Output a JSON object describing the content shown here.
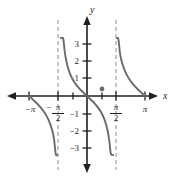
{
  "figure": {
    "width": 173,
    "height": 177,
    "background": "#ffffff",
    "curve_color": "#6b6b6b",
    "axis_color": "#231f20",
    "asymptote_color": "#8c8c8c"
  },
  "axes": {
    "x_label": "x",
    "y_label": "y",
    "x_axis_y_px": 96,
    "y_axis_x_px": 87,
    "x_left_px": 8,
    "x_right_px": 157,
    "y_top_px": 16,
    "y_bottom_px": 172,
    "px_per_half_pi": 29,
    "px_per_unit": 17
  },
  "x_ticks": [
    {
      "label": "−π",
      "value": -3.14159,
      "x_px": 29,
      "show_label": true
    },
    {
      "label": "",
      "value": -1.5708,
      "x_px": 58,
      "show_label": false
    },
    {
      "label": "",
      "value": -0.7854,
      "x_px": 73,
      "show_label": false
    },
    {
      "label": "",
      "value": 0.7854,
      "x_px": 102,
      "show_label": false
    },
    {
      "label": "",
      "value": 1.5708,
      "x_px": 116,
      "show_label": false
    },
    {
      "label": "π",
      "value": 3.14159,
      "x_px": 145,
      "show_label": true
    }
  ],
  "x_fraction_ticks": [
    {
      "lead": "−",
      "numerator": "π",
      "denominator": "2",
      "value": -1.5708,
      "x_px": 58
    },
    {
      "lead": "",
      "numerator": "π",
      "denominator": "2",
      "value": 1.5708,
      "x_px": 116
    }
  ],
  "y_ticks": [
    {
      "label": "3",
      "value": 3,
      "y_px": 44
    },
    {
      "label": "2",
      "value": 2,
      "y_px": 61
    },
    {
      "label": "1",
      "value": 1,
      "y_px": 78
    },
    {
      "label": "−1",
      "value": -1,
      "y_px": 114
    },
    {
      "label": "−2",
      "value": -2,
      "y_px": 131
    },
    {
      "label": "−3",
      "value": -3,
      "y_px": 148
    }
  ],
  "asymptotes": [
    {
      "name": "asymptote-neg-half-pi",
      "value": -1.5708,
      "x_px": 58,
      "y_top_px": 20,
      "y_bottom_px": 170
    },
    {
      "name": "asymptote-pos-half-pi",
      "value": 1.5708,
      "x_px": 116,
      "y_top_px": 20,
      "y_bottom_px": 170
    }
  ],
  "markers": [
    {
      "name": "point-on-curve",
      "x_value": 0.7854,
      "y_value": 1,
      "x_px": 102,
      "y_px": 89,
      "radius_px": 2.4
    }
  ],
  "chart_data": {
    "type": "line",
    "title": "",
    "subtitle": "",
    "xlabel": "x",
    "ylabel": "y",
    "function": "y = tan(x)",
    "xlim": [
      -3.6,
      3.6
    ],
    "ylim": [
      -3.6,
      3.6
    ],
    "grid": false,
    "legend": null,
    "x_tick_labels": [
      "−π",
      "−π/2",
      "π/2",
      "π"
    ],
    "x_tick_values": [
      -3.14159,
      -1.5708,
      1.5708,
      3.14159
    ],
    "y_tick_labels": [
      "3",
      "2",
      "1",
      "−1",
      "−2",
      "−3"
    ],
    "y_tick_values": [
      3,
      2,
      1,
      -1,
      -2,
      -3
    ],
    "asymptote_x_values": [
      -1.5708,
      1.5708
    ],
    "annotations": [
      {
        "label": "",
        "x": 0.7854,
        "y": 1,
        "type": "point"
      }
    ],
    "series": [
      {
        "name": "tan(x) left branch",
        "x": [
          -3.15,
          -3.05,
          -2.95,
          -2.85,
          -2.75,
          -2.65,
          -2.55,
          -2.45,
          -2.35,
          -2.25,
          -2.15,
          -2.05,
          -1.95,
          -1.85,
          -1.78,
          -1.72,
          -1.68,
          -1.65,
          -1.63,
          -1.62
        ],
        "y": [
          0.008,
          -0.091,
          -0.191,
          -0.293,
          -0.398,
          -0.509,
          -0.627,
          -0.756,
          -0.9,
          -1.064,
          -1.255,
          -1.487,
          -1.778,
          -2.161,
          -2.57,
          -3.2,
          -3.85,
          -4.49,
          -5.13,
          -5.58
        ]
      },
      {
        "name": "tan(x) center branch",
        "x": [
          -1.52,
          -1.5,
          -1.46,
          -1.42,
          -1.35,
          -1.28,
          -1.2,
          -1.1,
          -1.0,
          -0.9,
          -0.8,
          -0.7,
          -0.6,
          -0.5,
          -0.4,
          -0.3,
          -0.2,
          -0.1,
          0.0,
          0.1,
          0.2,
          0.3,
          0.4,
          0.5,
          0.6,
          0.7,
          0.8,
          0.9,
          1.0,
          1.1,
          1.2,
          1.28,
          1.35,
          1.42,
          1.46,
          1.5,
          1.52
        ],
        "y": [
          19.7,
          14.1,
          7.55,
          5.47,
          4.46,
          3.34,
          2.57,
          1.96,
          1.557,
          1.26,
          1.03,
          0.842,
          0.684,
          0.546,
          0.423,
          0.309,
          0.203,
          0.1,
          0.0,
          -0.1,
          -0.203,
          -0.309,
          -0.423,
          -0.546,
          -0.684,
          -0.842,
          -1.03,
          -1.26,
          -1.557,
          -1.96,
          -2.57,
          -3.34,
          -4.46,
          -5.47,
          -7.55,
          -14.1,
          -19.7
        ]
      },
      {
        "name": "tan(x) right branch",
        "x": [
          1.62,
          1.63,
          1.65,
          1.68,
          1.72,
          1.78,
          1.85,
          1.95,
          2.05,
          2.15,
          2.25,
          2.35,
          2.45,
          2.55,
          2.65,
          2.75,
          2.85,
          2.95,
          3.05,
          3.15
        ],
        "y": [
          5.58,
          5.13,
          4.49,
          3.85,
          3.2,
          2.57,
          2.161,
          1.778,
          1.487,
          1.255,
          1.064,
          0.9,
          0.756,
          0.627,
          0.509,
          0.398,
          0.293,
          0.191,
          0.091,
          -0.008
        ]
      }
    ]
  }
}
